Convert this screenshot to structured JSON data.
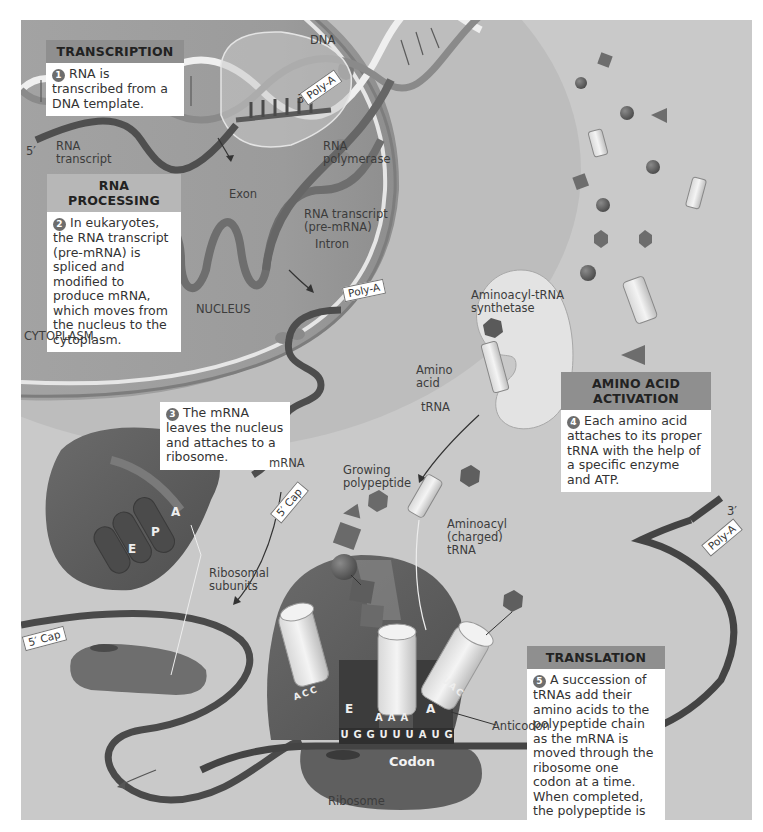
{
  "figure": {
    "background_color": "#c9c9c9",
    "nucleus_color": "#9a9a9a",
    "box_header_color": "#8f8f8f",
    "region_labels": {
      "nucleus": "NUCLEUS",
      "cytoplasm": "CYTOPLASM"
    },
    "steps": [
      {
        "number": "1",
        "title": "TRANSCRIPTION",
        "text": "RNA is transcribed from a DNA template."
      },
      {
        "number": "2",
        "title": "RNA PROCESSING",
        "text": "In eukaryotes, the RNA transcript (pre-mRNA) is spliced and modified to produce mRNA, which moves from the nucleus to the cytoplasm."
      },
      {
        "number": "3",
        "title": "",
        "text": "The mRNA leaves the nucleus and attaches to a ribosome."
      },
      {
        "number": "4",
        "title": "AMINO ACID ACTIVATION",
        "text": "Each amino acid attaches to its proper tRNA with the help of a specific enzyme and ATP."
      },
      {
        "number": "5",
        "title": "TRANSLATION",
        "text": "A succession of tRNAs add their amino acids to the polypeptide chain as the mRNA is moved through the ribosome one codon at a time. When completed, the polypeptide is released from the ribosome."
      }
    ],
    "labels": {
      "dna": "DNA",
      "three_prime_top": "3′",
      "five_prime": "5′",
      "rna_transcript": "RNA\ntranscript",
      "rna_polymerase": "RNA\npolymerase",
      "exon": "Exon",
      "rna_transcript_pre": "RNA transcript\n(pre-mRNA)",
      "intron": "Intron",
      "poly_a": "Poly-A",
      "aminoacyl_trna_synthetase": "Aminoacyl-tRNA\nsynthetase",
      "amino_acid": "Amino\nacid",
      "trna": "tRNA",
      "mrna": "mRNA",
      "five_prime_cap": "5′ Cap",
      "growing_polypeptide": "Growing\npolypeptide",
      "aminoacyl_charged_trna": "Aminoacyl\n(charged)\ntRNA",
      "ribosomal_subunits": "Ribosomal\nsubunits",
      "anticodon": "Anticodon",
      "codon": "Codon",
      "ribosome": "Ribosome",
      "three_prime_right": "3′",
      "site_e": "E",
      "site_p": "P",
      "site_a": "A"
    },
    "sequences": {
      "mrna_codons": [
        "U",
        "G",
        "G",
        "U",
        "U",
        "U",
        "A",
        "U",
        "G"
      ],
      "anticodon_left": "ACC",
      "anticodon_middle": "AAA",
      "anticodon_right": "UAC"
    }
  }
}
